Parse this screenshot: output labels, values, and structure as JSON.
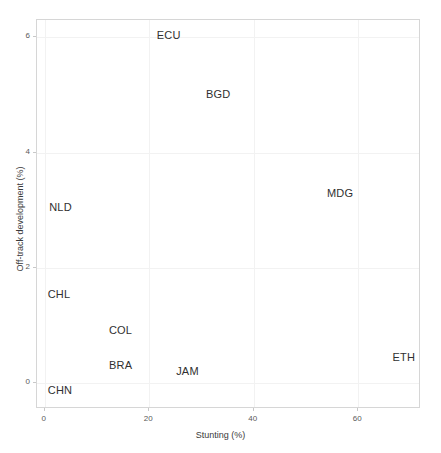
{
  "chart_data": {
    "type": "scatter",
    "title": "",
    "subtitle": "",
    "xlabel": "Stunting (%)",
    "ylabel": "Off-track development (%)",
    "xlim": [
      -1.5,
      72
    ],
    "ylim": [
      -0.45,
      6.3
    ],
    "xticks": [
      0,
      20,
      40,
      60
    ],
    "xticklabels": [
      "0",
      "20",
      "40",
      "60"
    ],
    "yticks": [
      0,
      2,
      4,
      6
    ],
    "yticklabels": [
      "0",
      "2",
      "4",
      "6"
    ],
    "grid": true,
    "legend": "none",
    "marker": "text-label-only",
    "points": [
      {
        "label": "ECU",
        "x": 23.7,
        "y": 6.04
      },
      {
        "label": "BGD",
        "x": 33.2,
        "y": 5.02
      },
      {
        "label": "MDG",
        "x": 56.5,
        "y": 3.29
      },
      {
        "label": "NLD",
        "x": 3.0,
        "y": 3.06
      },
      {
        "label": "CHL",
        "x": 2.7,
        "y": 1.54
      },
      {
        "label": "COL",
        "x": 14.5,
        "y": 0.92
      },
      {
        "label": "BRA",
        "x": 14.5,
        "y": 0.31
      },
      {
        "label": "JAM",
        "x": 27.3,
        "y": 0.21
      },
      {
        "label": "CHN",
        "x": 2.9,
        "y": -0.12
      },
      {
        "label": "ETH",
        "x": 68.7,
        "y": 0.45
      }
    ]
  },
  "colors": {
    "background": "#ffffff",
    "panel_border": "#d6d6d6",
    "gridline": "#f2f2f2",
    "text": "#303030",
    "axis_text": "#5a5a5a"
  }
}
